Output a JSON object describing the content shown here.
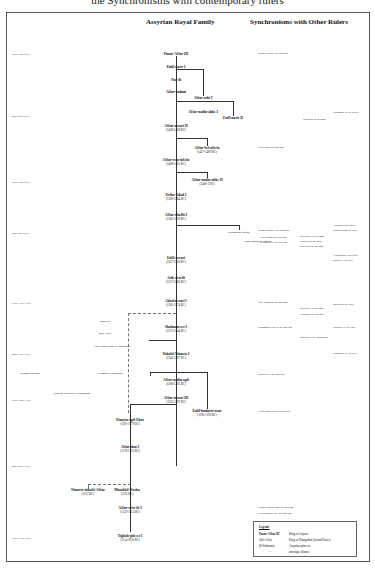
{
  "caption": "the Synchronisms with contemporary rulers",
  "headers": {
    "family": "Assyrian Royal Family",
    "synchronisms": "Synchronisms with Other Rulers"
  },
  "eras": [
    {
      "label": "(early 15th c.BC)",
      "y": 53
    },
    {
      "label": "(mid 15th c.BC)",
      "y": 115
    },
    {
      "label": "(early 14th c.BC)",
      "y": 181
    },
    {
      "label": "(mid 14th c.BC)",
      "y": 232
    },
    {
      "label": "(early 13th c. BC)",
      "y": 302
    },
    {
      "label": "(mid 13th c. BC)",
      "y": 353
    },
    {
      "label": "(early 12th c. BC)",
      "y": 399
    },
    {
      "label": "(mid 12th c. BC)",
      "y": 465
    },
    {
      "label": "(early 11th c. BC)",
      "y": 537
    }
  ],
  "kings": [
    {
      "name": "Puzur-Aššur III",
      "dates": "",
      "x": 176,
      "y": 52
    },
    {
      "name": "Enlil-nasir I",
      "dates": "",
      "x": 176,
      "y": 65
    },
    {
      "name": "Nur-ili",
      "dates": "",
      "x": 176,
      "y": 78
    },
    {
      "name": "Aššur-šaduni",
      "dates": "",
      "x": 176,
      "y": 90
    },
    {
      "name": "Aššur-rabi I",
      "dates": "",
      "x": 203,
      "y": 96
    },
    {
      "name": "Aššur-nadin-ahhe I",
      "dates": "",
      "x": 203,
      "y": 110
    },
    {
      "name": "Enlil-nasir II",
      "dates": "",
      "x": 233,
      "y": 116
    },
    {
      "name": "Aššur-nerari II",
      "dates": "(1428-1418 BC)",
      "x": 176,
      "y": 124
    },
    {
      "name": "Aššur-bel-nišešu",
      "dates": "(1417-1409 BC)",
      "x": 207,
      "y": 146
    },
    {
      "name": "Aššur-rem-nišešu",
      "dates": "(1408-1401 BC)",
      "x": 176,
      "y": 158
    },
    {
      "name": "Aššur-nadin-ahhe II",
      "dates": "(1400-1391)",
      "x": 207,
      "y": 178
    },
    {
      "name": "Eriba-Adad I",
      "dates": "(1390-1364 BC)",
      "x": 176,
      "y": 193
    },
    {
      "name": "Aššur-uballit I",
      "dates": "(1363-1328 BC)",
      "x": 176,
      "y": 213
    },
    {
      "name": "Enlil-nerari",
      "dates": "(1327-1318 BC)",
      "x": 176,
      "y": 256
    },
    {
      "name": "Arik-den-ili",
      "dates": "(1317-1306 BC)",
      "x": 176,
      "y": 276
    },
    {
      "name": "Adad-nerari I",
      "dates": "(1305-1274 BC)",
      "x": 176,
      "y": 299
    },
    {
      "name": "Shalmaneser I",
      "dates": "(1273-1244 BC)",
      "x": 176,
      "y": 325
    },
    {
      "name": "Tukulti-Ninurta I",
      "dates": "(1243-1207 BC)",
      "x": 176,
      "y": 352
    },
    {
      "name": "Aššur-nadin-apli",
      "dates": "(1206-1203 BC)",
      "x": 176,
      "y": 378
    },
    {
      "name": "Aššur-nerari III",
      "dates": "(1202-1197 BC)",
      "x": 176,
      "y": 396
    },
    {
      "name": "Enlil-kudurri-usur",
      "dates": "(1196-1192 BC)",
      "x": 207,
      "y": 409
    },
    {
      "name": "Ninurta-apil-Ekur",
      "dates": "(1191-1179 BC)",
      "x": 130,
      "y": 418
    },
    {
      "name": "Aššur-dan I",
      "dates": "(1178-1133 BC)",
      "x": 130,
      "y": 445
    },
    {
      "name": "Ninurta-tukulti-Aššur",
      "dates": "(1133 BC)",
      "x": 88,
      "y": 488
    },
    {
      "name": "Mutakkil-Nusku",
      "dates": "(1132 BC)",
      "x": 127,
      "y": 488
    },
    {
      "name": "Aššur-reša-iši I",
      "dates": "(1132-1115 BC)",
      "x": 130,
      "y": 506
    },
    {
      "name": "Tiglath-pileser I",
      "dates": "(1114-1076 BC)",
      "x": 130,
      "y": 534
    }
  ],
  "minor": [
    {
      "label": "Ibashi-ili",
      "x": 105,
      "y": 320
    },
    {
      "label": "Qibi-Aššur",
      "x": 105,
      "y": 332
    },
    {
      "label": "Aššur-nadin-ahhe in Hanigalbat",
      "x": 112,
      "y": 345
    },
    {
      "label": "Sulmanu-mušabši",
      "x": 30,
      "y": 372
    },
    {
      "label": "Ili-padâ in Hanigalbat",
      "x": 110,
      "y": 372
    },
    {
      "label": "(king of Ninevah) in Hanigalbat",
      "x": 72,
      "y": 392
    },
    {
      "label": "(Muballitat-Šerua)",
      "x": 239,
      "y": 231
    },
    {
      "label": "Kara-hardaš of Babylon",
      "x": 258,
      "y": 240
    }
  ],
  "synchronisms": [
    {
      "label": "Burna-Buriaš I of Babylon",
      "x": 258,
      "y": 52
    },
    {
      "label": "Thutmose III of Egypt",
      "x": 333,
      "y": 111
    },
    {
      "label": "Saustatar of Mitanni",
      "x": 303,
      "y": 118
    },
    {
      "label": "Kara-indaš of Babylon",
      "x": 258,
      "y": 146
    },
    {
      "label": "Burna-Buriaš II of Babylon",
      "x": 258,
      "y": 229
    },
    {
      "label": "Nazi-Bugaš of Babylon",
      "x": 260,
      "y": 236
    },
    {
      "label": "Kurigalzu II of Babylon",
      "x": 260,
      "y": 241
    },
    {
      "label": "Suttarna II of Mitanni",
      "x": 300,
      "y": 235
    },
    {
      "label": "Tušratta of Mitanni",
      "x": 300,
      "y": 240
    },
    {
      "label": "Šattiwaza of Mitanni",
      "x": 300,
      "y": 245
    },
    {
      "label": "Akhenaten of Egypt",
      "x": 333,
      "y": 224
    },
    {
      "label": "Suppiluliuma of Hatti",
      "x": 333,
      "y": 229
    },
    {
      "label": "Arnuwanda II of Hatti",
      "x": 333,
      "y": 254
    },
    {
      "label": "Muršili II of Hatti",
      "x": 333,
      "y": 259
    },
    {
      "label": "Nazi-Maruttaš of Babylon",
      "x": 258,
      "y": 301
    },
    {
      "label": "Šattuara I of Mitanni",
      "x": 300,
      "y": 307
    },
    {
      "label": "Wasašatta of Mitanni",
      "x": 300,
      "y": 313
    },
    {
      "label": "Muwatalli of Hatti",
      "x": 333,
      "y": 303
    },
    {
      "label": "Kadašman-Enlil II of Babylon",
      "x": 258,
      "y": 326
    },
    {
      "label": "Šattuara II of Hanigalbat",
      "x": 300,
      "y": 336
    },
    {
      "label": "Hattušili III of Hatti",
      "x": 333,
      "y": 326
    },
    {
      "label": "Tudhaliya IV of Hatti",
      "x": 333,
      "y": 352
    },
    {
      "label": "Kaštiliaš IV of Babylon",
      "x": 258,
      "y": 373
    },
    {
      "label": "Adad-šuma-usur of Babylon",
      "x": 258,
      "y": 410
    },
    {
      "label": "Ninurta-nadin-šumi of Babylon",
      "x": 258,
      "y": 506
    },
    {
      "label": "Nebuchadnezzar I of Babylon",
      "x": 258,
      "y": 512
    }
  ],
  "legend": {
    "title": "Legend:",
    "rows": [
      {
        "key": "Puzur-Aššur III",
        "value": "King of Assyria"
      },
      {
        "key": "Qibi-Aššur",
        "value": "King of Hanigalbat (Grand Vizier)"
      },
      {
        "key": "(Il-Sulmanu)",
        "value": "Assyrian princess"
      },
      {
        "key": "=",
        "value": "marriage alliance"
      }
    ]
  }
}
